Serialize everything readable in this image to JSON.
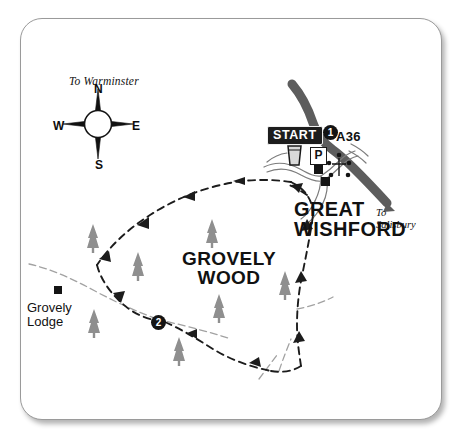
{
  "map": {
    "title": "Grovely Wood walk map",
    "background_color": "#ffffff",
    "card_border_color": "#9a9a9a",
    "road_color": "#5a5a5a",
    "tree_color": "#8e8e8e",
    "track_color": "#6f6f6f",
    "route_color": "#1a1a1a",
    "badge_color": "#1d1d1d"
  },
  "labels": {
    "to_warminster": "To Warminster",
    "to_salisbury": "To\nSalisbury",
    "road_number": "A36",
    "village": "GREAT\nWISHFORD",
    "wood": "GROVELY\nWOOD",
    "lodge": "Grovely\nLodge",
    "start": "START"
  },
  "waypoints": [
    {
      "number": "1",
      "near": "start-point"
    },
    {
      "number": "2",
      "near": "grovely-wood-south"
    }
  ],
  "compass": {
    "north": "N",
    "east": "E",
    "south": "S",
    "west": "W"
  },
  "icons": {
    "parking": "P",
    "pub": "pint-glass-icon",
    "church": "church-cross-icon",
    "building": "building-square-icon",
    "tree": "conifer-tree-icon"
  }
}
